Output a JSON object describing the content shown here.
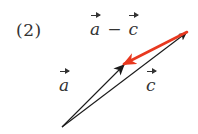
{
  "problem": {
    "number_label": "(2)",
    "expression": {
      "left": "a",
      "operator": "−",
      "right": "c"
    }
  },
  "vectors": {
    "a": {
      "label": "a",
      "color": "#1a1a1a",
      "from": [
        62,
        127
      ],
      "to": [
        124,
        65
      ]
    },
    "c": {
      "label": "c",
      "color": "#1a1a1a",
      "from": [
        62,
        127
      ],
      "to": [
        186,
        33
      ]
    },
    "a_minus_c": {
      "label": "a − c",
      "color": "#e8381f",
      "from": [
        187,
        32
      ],
      "to": [
        124,
        64
      ]
    }
  }
}
